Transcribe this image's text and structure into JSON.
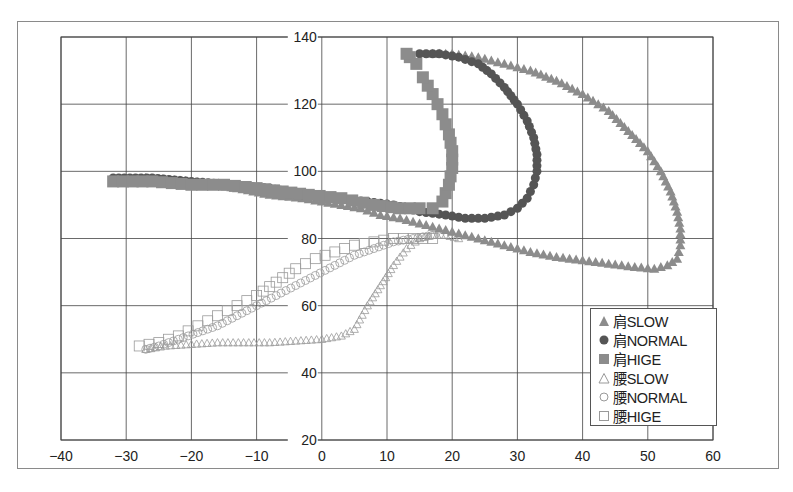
{
  "chart_data": {
    "type": "scatter",
    "title": "",
    "xlabel": "",
    "ylabel": "",
    "xlim": [
      -40,
      60
    ],
    "ylim": [
      20,
      140
    ],
    "x_ticks": [
      -40,
      -30,
      -20,
      -10,
      0,
      10,
      20,
      30,
      40,
      50,
      60
    ],
    "y_ticks": [
      20,
      40,
      60,
      80,
      100,
      120,
      140
    ],
    "y_axis_crosses_x_at": 0,
    "grid": true,
    "legend_position": "lower right inside",
    "legend": [
      "肩SLOW",
      "肩NORMAL",
      "肩HIGE",
      "腰SLOW",
      "腰NORMAL",
      "腰HIGE"
    ],
    "series": [
      {
        "name": "肩SLOW",
        "marker": "triangle-filled",
        "color": "#8c8c8c",
        "points": [
          [
            -27,
            98
          ],
          [
            -20,
            97
          ],
          [
            -13,
            95
          ],
          [
            -8,
            93
          ],
          [
            -3,
            92
          ],
          [
            0,
            91
          ],
          [
            3,
            90
          ],
          [
            6,
            89
          ],
          [
            9,
            87
          ],
          [
            12,
            86
          ],
          [
            14,
            85
          ],
          [
            16,
            84
          ],
          [
            18,
            83
          ],
          [
            20,
            82
          ],
          [
            24,
            80
          ],
          [
            28,
            78
          ],
          [
            32,
            76
          ],
          [
            36,
            74.5
          ],
          [
            40,
            73.5
          ],
          [
            44,
            72.5
          ],
          [
            48,
            71.5
          ],
          [
            51,
            71
          ],
          [
            53,
            72
          ],
          [
            54.5,
            74
          ],
          [
            55,
            78
          ],
          [
            55,
            83
          ],
          [
            54.5,
            88
          ],
          [
            53.5,
            94
          ],
          [
            52,
            100
          ],
          [
            50,
            106
          ],
          [
            47,
            112
          ],
          [
            44,
            118
          ],
          [
            40,
            123
          ],
          [
            36,
            127
          ],
          [
            32,
            130
          ],
          [
            28,
            132
          ],
          [
            24,
            134
          ],
          [
            20,
            135
          ],
          [
            17,
            135
          ]
        ]
      },
      {
        "name": "肩NORMAL",
        "marker": "circle-filled",
        "color": "#555555",
        "points": [
          [
            -32,
            98
          ],
          [
            -26,
            98
          ],
          [
            -20,
            97
          ],
          [
            -14,
            96
          ],
          [
            -8,
            95
          ],
          [
            -3,
            93
          ],
          [
            2,
            92
          ],
          [
            7,
            91
          ],
          [
            11,
            90
          ],
          [
            15,
            88
          ],
          [
            19,
            87
          ],
          [
            22,
            86
          ],
          [
            25,
            86
          ],
          [
            28,
            87
          ],
          [
            30,
            89
          ],
          [
            31.5,
            92
          ],
          [
            32.5,
            96
          ],
          [
            33,
            100
          ],
          [
            33,
            105
          ],
          [
            32.5,
            110
          ],
          [
            31.5,
            115
          ],
          [
            30,
            120
          ],
          [
            28,
            125
          ],
          [
            26,
            129
          ],
          [
            24,
            132
          ],
          [
            21,
            134
          ],
          [
            18,
            135
          ],
          [
            15,
            135
          ]
        ]
      },
      {
        "name": "肩HIGE",
        "marker": "square-filled",
        "color": "#8c8c8c",
        "points": [
          [
            -32,
            97
          ],
          [
            -26,
            97
          ],
          [
            -20,
            96
          ],
          [
            -15,
            96
          ],
          [
            -10,
            95
          ],
          [
            -6,
            94
          ],
          [
            -2,
            93
          ],
          [
            3,
            92
          ],
          [
            8,
            90
          ],
          [
            12,
            89
          ],
          [
            15,
            89
          ],
          [
            17,
            89
          ],
          [
            18.5,
            91
          ],
          [
            19.5,
            96
          ],
          [
            20,
            101
          ],
          [
            20,
            106
          ],
          [
            19.5,
            111
          ],
          [
            18.5,
            117
          ],
          [
            17,
            123
          ],
          [
            15.5,
            128
          ],
          [
            14.5,
            132
          ],
          [
            13.5,
            134
          ],
          [
            13,
            135
          ]
        ]
      },
      {
        "name": "腰SLOW",
        "marker": "triangle-open",
        "color": "#9a9a9a",
        "points": [
          [
            -27,
            47
          ],
          [
            -24,
            48
          ],
          [
            -20,
            48.5
          ],
          [
            -16,
            49
          ],
          [
            -12,
            49
          ],
          [
            -8,
            49
          ],
          [
            -4,
            49.5
          ],
          [
            0,
            50
          ],
          [
            3,
            51
          ],
          [
            5,
            53
          ],
          [
            7,
            60
          ],
          [
            9,
            66
          ],
          [
            11,
            72
          ],
          [
            13,
            77
          ],
          [
            15,
            80
          ],
          [
            17,
            81
          ],
          [
            19,
            81
          ],
          [
            21,
            80
          ]
        ]
      },
      {
        "name": "腰NORMAL",
        "marker": "circle-open",
        "color": "#9a9a9a",
        "points": [
          [
            -27,
            47
          ],
          [
            -25,
            48
          ],
          [
            -22,
            50
          ],
          [
            -19,
            52
          ],
          [
            -16,
            54
          ],
          [
            -13,
            57
          ],
          [
            -10,
            60
          ],
          [
            -7,
            63
          ],
          [
            -4,
            66
          ],
          [
            -1,
            69
          ],
          [
            2,
            72
          ],
          [
            5,
            75
          ],
          [
            8,
            77
          ],
          [
            11,
            79
          ],
          [
            14,
            80
          ],
          [
            17,
            81
          ]
        ]
      },
      {
        "name": "腰HIGE",
        "marker": "square-open",
        "color": "#9a9a9a",
        "points": [
          [
            -28,
            48
          ],
          [
            -25,
            49
          ],
          [
            -22,
            51
          ],
          [
            -19,
            54
          ],
          [
            -16,
            57
          ],
          [
            -13,
            60
          ],
          [
            -10,
            63
          ],
          [
            -7,
            67
          ],
          [
            -4,
            71
          ],
          [
            -1,
            74
          ],
          [
            2,
            76
          ],
          [
            5,
            78
          ],
          [
            8,
            79
          ],
          [
            11,
            80
          ],
          [
            14,
            80
          ],
          [
            17,
            80
          ]
        ]
      }
    ]
  },
  "legend": {
    "items": [
      {
        "label": "肩SLOW",
        "marker": "triangle-filled"
      },
      {
        "label": "肩NORMAL",
        "marker": "circle-filled"
      },
      {
        "label": "肩HIGE",
        "marker": "square-filled"
      },
      {
        "label": "腰SLOW",
        "marker": "triangle-open"
      },
      {
        "label": "腰NORMAL",
        "marker": "circle-open"
      },
      {
        "label": "腰HIGE",
        "marker": "square-open"
      }
    ]
  }
}
